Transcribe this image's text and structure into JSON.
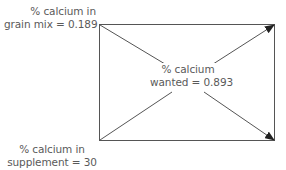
{
  "diagram": {
    "type": "pearson-square",
    "inputs": [
      {
        "id": "grain_mix",
        "line1": "% calcium in",
        "line2": "grain mix = 0.189",
        "value": 0.189
      },
      {
        "id": "supplement",
        "line1": "% calcium in",
        "line2": "supplement = 30",
        "value": 30
      }
    ],
    "target": {
      "line1": "% calcium",
      "line2": "wanted = 0.893",
      "value": 0.893
    },
    "colors": {
      "line": "#555555",
      "text": "#5a5a5a",
      "background": "#ffffff"
    }
  }
}
